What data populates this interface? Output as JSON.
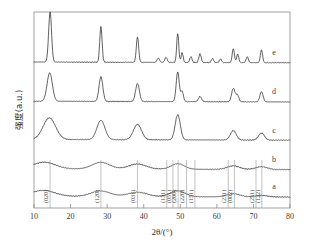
{
  "figure": {
    "background": "#ffffff",
    "trace_color": "#2b2b2b",
    "frame_color": "#8a8a8a"
  },
  "chart_data": {
    "type": "line",
    "title": "",
    "subtitle": "",
    "xlabel": "2θ/(°)",
    "ylabel": "强度(a.u.)",
    "xlim": [
      10,
      80
    ],
    "ylim": [
      0,
      1
    ],
    "grid": false,
    "legend_position": "right-inline",
    "xticks": [
      10,
      20,
      30,
      40,
      50,
      60,
      70,
      80
    ],
    "xticklabels": [
      "10",
      "20",
      "30",
      "40",
      "50",
      "60",
      "70",
      "80"
    ],
    "yticks": [],
    "yticklabels": [],
    "note": "Stacked XRD patterns, offset vertically; intensity in arbitrary units",
    "series": [
      {
        "name": "a",
        "label": "a",
        "crystallinity": "amorphous",
        "baseline_offset": 0.06,
        "peaks": [
          {
            "two_theta": 12.5,
            "height": 0.03,
            "width": 3.2
          },
          {
            "two_theta": 28.2,
            "height": 0.028,
            "width": 2.6
          },
          {
            "two_theta": 38.3,
            "height": 0.022,
            "width": 2.6
          },
          {
            "two_theta": 49.3,
            "height": 0.03,
            "width": 2.0
          },
          {
            "two_theta": 64.5,
            "height": 0.016,
            "width": 1.8
          },
          {
            "two_theta": 72.2,
            "height": 0.008,
            "width": 1.6
          }
        ]
      },
      {
        "name": "b",
        "label": "b",
        "crystallinity": "near-amorphous",
        "baseline_offset": 0.2,
        "peaks": [
          {
            "two_theta": 12.8,
            "height": 0.034,
            "width": 3.0
          },
          {
            "two_theta": 28.3,
            "height": 0.034,
            "width": 2.4
          },
          {
            "two_theta": 38.3,
            "height": 0.026,
            "width": 2.4
          },
          {
            "two_theta": 49.3,
            "height": 0.028,
            "width": 1.8
          },
          {
            "two_theta": 64.5,
            "height": 0.018,
            "width": 1.7
          },
          {
            "two_theta": 72.2,
            "height": 0.014,
            "width": 1.6
          }
        ]
      },
      {
        "name": "c",
        "label": "c",
        "crystallinity": "partially crystalline",
        "baseline_offset": 0.35,
        "peaks": [
          {
            "two_theta": 14.2,
            "height": 0.11,
            "width": 1.7
          },
          {
            "two_theta": 28.3,
            "height": 0.098,
            "width": 1.1
          },
          {
            "two_theta": 38.3,
            "height": 0.078,
            "width": 1.1
          },
          {
            "two_theta": 49.3,
            "height": 0.128,
            "width": 0.7
          },
          {
            "two_theta": 64.5,
            "height": 0.048,
            "width": 0.8
          },
          {
            "two_theta": 72.2,
            "height": 0.036,
            "width": 0.8
          }
        ]
      },
      {
        "name": "d",
        "label": "d",
        "crystallinity": "crystalline",
        "baseline_offset": 0.545,
        "peaks": [
          {
            "two_theta": 14.3,
            "height": 0.145,
            "width": 0.72
          },
          {
            "two_theta": 28.3,
            "height": 0.125,
            "width": 0.52
          },
          {
            "two_theta": 38.3,
            "height": 0.092,
            "width": 0.52
          },
          {
            "two_theta": 49.3,
            "height": 0.152,
            "width": 0.42
          },
          {
            "two_theta": 50.5,
            "height": 0.052,
            "width": 0.36
          },
          {
            "two_theta": 55.4,
            "height": 0.026,
            "width": 0.44
          },
          {
            "two_theta": 64.5,
            "height": 0.068,
            "width": 0.46
          },
          {
            "two_theta": 65.6,
            "height": 0.034,
            "width": 0.4
          },
          {
            "two_theta": 72.2,
            "height": 0.052,
            "width": 0.44
          }
        ]
      },
      {
        "name": "e",
        "label": "e",
        "crystallinity": "highly crystalline",
        "baseline_offset": 0.745,
        "peaks": [
          {
            "two_theta": 14.4,
            "height": 0.255,
            "width": 0.4
          },
          {
            "two_theta": 28.3,
            "height": 0.18,
            "width": 0.32
          },
          {
            "two_theta": 38.3,
            "height": 0.13,
            "width": 0.32
          },
          {
            "two_theta": 44.0,
            "height": 0.022,
            "width": 0.34
          },
          {
            "two_theta": 46.1,
            "height": 0.026,
            "width": 0.32
          },
          {
            "two_theta": 49.3,
            "height": 0.148,
            "width": 0.28
          },
          {
            "two_theta": 50.5,
            "height": 0.05,
            "width": 0.28
          },
          {
            "two_theta": 52.9,
            "height": 0.03,
            "width": 0.3
          },
          {
            "two_theta": 55.4,
            "height": 0.044,
            "width": 0.32
          },
          {
            "two_theta": 58.8,
            "height": 0.02,
            "width": 0.3
          },
          {
            "two_theta": 61.0,
            "height": 0.018,
            "width": 0.3
          },
          {
            "two_theta": 64.5,
            "height": 0.072,
            "width": 0.3
          },
          {
            "two_theta": 65.7,
            "height": 0.044,
            "width": 0.28
          },
          {
            "two_theta": 68.3,
            "height": 0.03,
            "width": 0.3
          },
          {
            "two_theta": 72.2,
            "height": 0.066,
            "width": 0.3
          }
        ]
      }
    ],
    "miller_indices": [
      {
        "label": "(020)",
        "two_theta": 14.4
      },
      {
        "label": "(120)",
        "two_theta": 28.3
      },
      {
        "label": "(031)",
        "two_theta": 38.3
      },
      {
        "label": "(131)",
        "two_theta": 46.3
      },
      {
        "label": "(051)",
        "two_theta": 48.0
      },
      {
        "label": "(200)",
        "two_theta": 49.4
      },
      {
        "label": "(220)",
        "two_theta": 51.7
      },
      {
        "label": "(151)",
        "two_theta": 54.0
      },
      {
        "label": "(231)",
        "two_theta": 63.1
      },
      {
        "label": "(002)",
        "two_theta": 64.8
      },
      {
        "label": "(251)",
        "two_theta": 70.7
      },
      {
        "label": "(122)",
        "two_theta": 72.3
      }
    ]
  }
}
